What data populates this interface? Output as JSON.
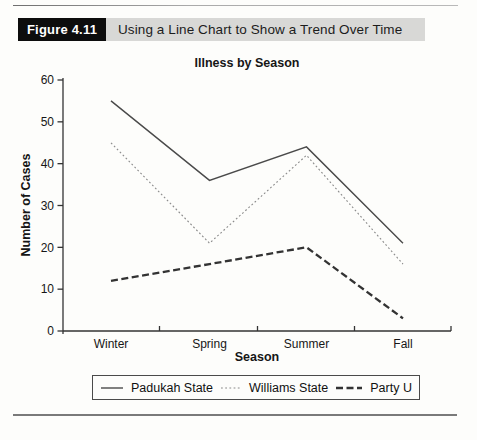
{
  "figure": {
    "label": "Figure 4.11",
    "title": "Using a Line Chart to Show a Trend Over Time"
  },
  "chart_data": {
    "type": "line",
    "title": "Illness by Season",
    "xlabel": "Season",
    "ylabel": "Number of Cases",
    "categories": [
      "Winter",
      "Spring",
      "Summer",
      "Fall"
    ],
    "series": [
      {
        "name": "Padukah State",
        "style": "solid",
        "color": "#4a4a4a",
        "values": [
          55,
          36,
          44,
          21
        ]
      },
      {
        "name": "Williams State",
        "style": "dotted",
        "color": "#8a8a8a",
        "values": [
          45,
          21,
          42,
          16
        ]
      },
      {
        "name": "Party U",
        "style": "dashed",
        "color": "#333333",
        "values": [
          12,
          16,
          20,
          3
        ]
      }
    ],
    "ylim": [
      0,
      60
    ],
    "yticks": [
      0,
      10,
      20,
      30,
      40,
      50,
      60
    ],
    "grid": false,
    "legend_position": "bottom"
  },
  "colors": {
    "header_label_bg": "#0d0d0d",
    "header_label_text": "#ffffff",
    "header_title_bg": "#d8d8d6",
    "axis": "#333333",
    "page_bg": "#fdfdfb"
  }
}
